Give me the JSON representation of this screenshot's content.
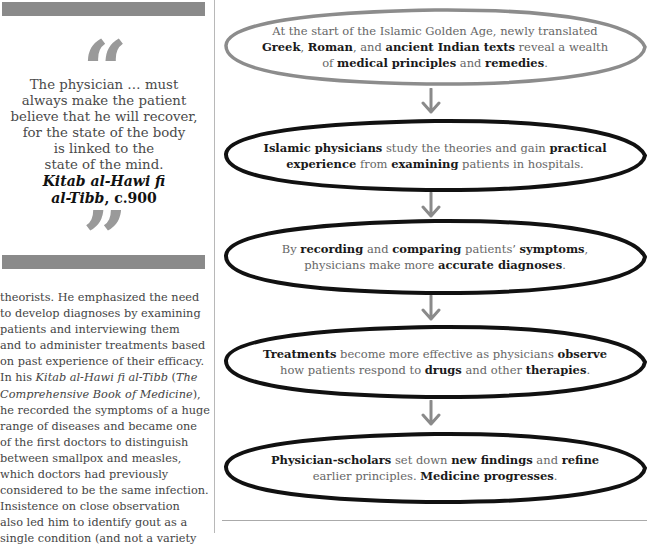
{
  "sidebar": {
    "quote": {
      "open_mark": "“",
      "close_mark": "”",
      "lines": [
        "The physician … must",
        "always make the patient",
        "believe that he will recover,",
        "for the state of the body",
        "is linked to the",
        "state of the mind."
      ],
      "source_title_line1": "Kitab al-Hawi fi",
      "source_title_line2": "al-Tibb",
      "source_date": ", c.900"
    },
    "body_lines": [
      "theorists. He emphasized the need",
      "to develop diagnoses by examining",
      "patients and interviewing them",
      "and to administer treatments based",
      "on past experience of their efficacy.",
      "In his |Kitab al-Hawi fi al-Tibb| (|The",
      "|Comprehensive Book of Medicine|),",
      "he recorded the symptoms of a huge",
      "range of diseases and became one",
      "of the first doctors to distinguish",
      "between smallpox and measles,",
      "which doctors had previously",
      "considered to be the same infection.",
      "Insistence on close observation",
      "also led him to identify gout as a",
      "single condition (and not a variety"
    ]
  },
  "flow": {
    "steps": [
      {
        "lines": [
          [
            [
              "At the start of the Islamic Golden Age, newly translated",
              false
            ]
          ],
          [
            [
              "Greek",
              true
            ],
            [
              ", ",
              false
            ],
            [
              "Roman",
              true
            ],
            [
              ", and ",
              false
            ],
            [
              "ancient Indian texts",
              true
            ],
            [
              " reveal a wealth",
              false
            ]
          ],
          [
            [
              "of ",
              false
            ],
            [
              "medical principles",
              true
            ],
            [
              " and ",
              false
            ],
            [
              "remedies",
              true
            ],
            [
              ".",
              false
            ]
          ]
        ],
        "outline_color": "#8c8c8c"
      },
      {
        "lines": [
          [
            [
              "Islamic physicians",
              true
            ],
            [
              " study the theories and gain ",
              false
            ],
            [
              "practical",
              true
            ]
          ],
          [
            [
              "experience",
              true
            ],
            [
              " from ",
              false
            ],
            [
              "examining",
              true
            ],
            [
              " patients in hospitals.",
              false
            ]
          ]
        ],
        "outline_color": "#111111"
      },
      {
        "lines": [
          [
            [
              "By ",
              false
            ],
            [
              "recording",
              true
            ],
            [
              " and ",
              false
            ],
            [
              "comparing",
              true
            ],
            [
              " patients’ ",
              false
            ],
            [
              "symptoms",
              true
            ],
            [
              ",",
              false
            ]
          ],
          [
            [
              "physicians make more ",
              false
            ],
            [
              "accurate diagnoses",
              true
            ],
            [
              ".",
              false
            ]
          ]
        ],
        "outline_color": "#111111"
      },
      {
        "lines": [
          [
            [
              "Treatments",
              true
            ],
            [
              " become more effective as physicians ",
              false
            ],
            [
              "observe",
              true
            ]
          ],
          [
            [
              "how patients respond to ",
              false
            ],
            [
              "drugs",
              true
            ],
            [
              " and other ",
              false
            ],
            [
              "therapies",
              true
            ],
            [
              ".",
              false
            ]
          ]
        ],
        "outline_color": "#111111"
      },
      {
        "lines": [
          [
            [
              "Physician-scholars",
              true
            ],
            [
              " set down ",
              false
            ],
            [
              "new findings",
              true
            ],
            [
              " and ",
              false
            ],
            [
              "refine",
              true
            ]
          ],
          [
            [
              "earlier principles. ",
              false
            ],
            [
              "Medicine progresses",
              true
            ],
            [
              ".",
              false
            ]
          ]
        ],
        "outline_color": "#111111"
      }
    ],
    "arrow_color": "#8a8a8a"
  },
  "colors": {
    "bar_gray": "#8a8a8a",
    "quote_mark_gray": "#9a9a9a",
    "text_dark": "#1a1a1a",
    "text_body": "#666666"
  }
}
